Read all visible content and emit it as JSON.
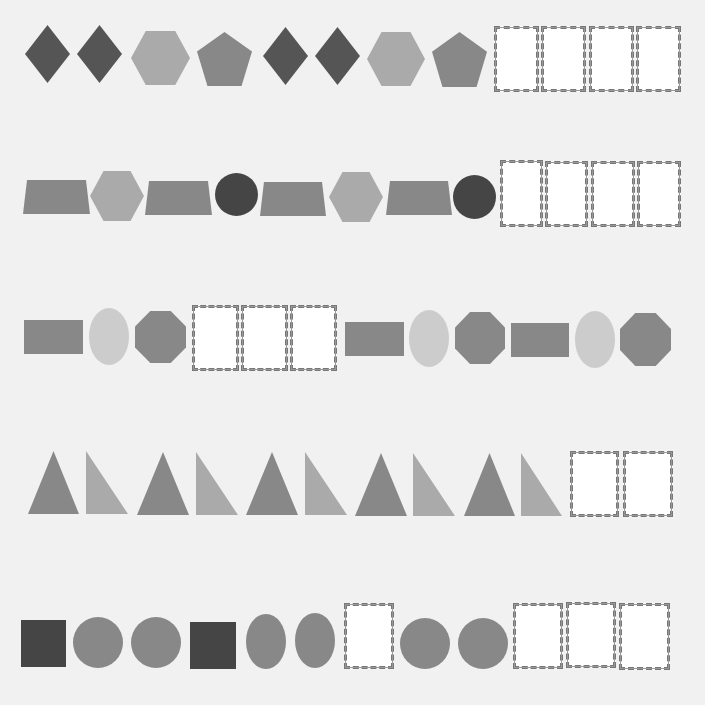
{
  "colors": {
    "background": "#f1f1f1",
    "dark": "#555555",
    "darker": "#454545",
    "medium": "#888888",
    "light": "#aaaaaa",
    "lighter": "#cccccc",
    "box_fill": "#ffffff",
    "box_border": "#777777"
  },
  "rows": [
    {
      "index": 1,
      "items": [
        {
          "type": "diamond",
          "color": "dark",
          "x": 25,
          "y": 25,
          "w": 45,
          "h": 58
        },
        {
          "type": "diamond",
          "color": "dark",
          "x": 77,
          "y": 25,
          "w": 45,
          "h": 58
        },
        {
          "type": "hexagon",
          "color": "light",
          "x": 131,
          "y": 31,
          "w": 59,
          "h": 54
        },
        {
          "type": "pentagon",
          "color": "medium",
          "x": 197,
          "y": 32,
          "w": 55,
          "h": 54
        },
        {
          "type": "diamond",
          "color": "dark",
          "x": 263,
          "y": 27,
          "w": 45,
          "h": 58
        },
        {
          "type": "diamond",
          "color": "dark",
          "x": 315,
          "y": 27,
          "w": 45,
          "h": 58
        },
        {
          "type": "hexagon",
          "color": "light",
          "x": 367,
          "y": 32,
          "w": 58,
          "h": 54
        },
        {
          "type": "pentagon",
          "color": "medium",
          "x": 432,
          "y": 32,
          "w": 55,
          "h": 55
        },
        {
          "type": "blank",
          "x": 494,
          "y": 26,
          "w": 45,
          "h": 66
        },
        {
          "type": "blank",
          "x": 541,
          "y": 26,
          "w": 45,
          "h": 66
        },
        {
          "type": "blank",
          "x": 589,
          "y": 26,
          "w": 45,
          "h": 66
        },
        {
          "type": "blank",
          "x": 636,
          "y": 26,
          "w": 45,
          "h": 66
        }
      ]
    },
    {
      "index": 2,
      "items": [
        {
          "type": "trapezoid",
          "color": "medium",
          "x": 23,
          "y": 180,
          "w": 67,
          "h": 34
        },
        {
          "type": "hexagon",
          "color": "light",
          "x": 90,
          "y": 171,
          "w": 54,
          "h": 50
        },
        {
          "type": "trapezoid",
          "color": "medium",
          "x": 145,
          "y": 181,
          "w": 67,
          "h": 34
        },
        {
          "type": "circle",
          "color": "darker",
          "x": 215,
          "y": 173,
          "w": 43,
          "h": 43
        },
        {
          "type": "trapezoid",
          "color": "medium",
          "x": 260,
          "y": 182,
          "w": 66,
          "h": 34
        },
        {
          "type": "hexagon",
          "color": "light",
          "x": 329,
          "y": 172,
          "w": 54,
          "h": 50
        },
        {
          "type": "trapezoid",
          "color": "medium",
          "x": 386,
          "y": 181,
          "w": 66,
          "h": 34
        },
        {
          "type": "circle",
          "color": "darker",
          "x": 453,
          "y": 175,
          "w": 43,
          "h": 44
        },
        {
          "type": "blank",
          "x": 500,
          "y": 160,
          "w": 43,
          "h": 67
        },
        {
          "type": "blank",
          "x": 545,
          "y": 161,
          "w": 43,
          "h": 66
        },
        {
          "type": "blank",
          "x": 591,
          "y": 161,
          "w": 44,
          "h": 66
        },
        {
          "type": "blank",
          "x": 637,
          "y": 161,
          "w": 44,
          "h": 66
        }
      ]
    },
    {
      "index": 3,
      "items": [
        {
          "type": "rectangle",
          "color": "medium",
          "x": 24,
          "y": 320,
          "w": 59,
          "h": 34
        },
        {
          "type": "ellipse",
          "color": "lighter",
          "x": 89,
          "y": 308,
          "w": 40,
          "h": 57
        },
        {
          "type": "octagon",
          "color": "medium",
          "x": 135,
          "y": 311,
          "w": 51,
          "h": 52
        },
        {
          "type": "blank",
          "x": 192,
          "y": 305,
          "w": 47,
          "h": 66
        },
        {
          "type": "blank",
          "x": 241,
          "y": 305,
          "w": 47,
          "h": 66
        },
        {
          "type": "blank",
          "x": 290,
          "y": 305,
          "w": 47,
          "h": 66
        },
        {
          "type": "rectangle",
          "color": "medium",
          "x": 345,
          "y": 322,
          "w": 59,
          "h": 34
        },
        {
          "type": "ellipse",
          "color": "lighter",
          "x": 409,
          "y": 310,
          "w": 40,
          "h": 57
        },
        {
          "type": "octagon",
          "color": "medium",
          "x": 455,
          "y": 312,
          "w": 50,
          "h": 52
        },
        {
          "type": "rectangle",
          "color": "medium",
          "x": 511,
          "y": 323,
          "w": 58,
          "h": 34
        },
        {
          "type": "ellipse",
          "color": "lighter",
          "x": 575,
          "y": 311,
          "w": 40,
          "h": 57
        },
        {
          "type": "octagon",
          "color": "medium",
          "x": 620,
          "y": 313,
          "w": 51,
          "h": 53
        }
      ]
    },
    {
      "index": 4,
      "items": [
        {
          "type": "triangle",
          "color": "medium",
          "x": 28,
          "y": 451,
          "w": 51,
          "h": 63
        },
        {
          "type": "right-triangle",
          "color": "light",
          "x": 86,
          "y": 451,
          "w": 42,
          "h": 63
        },
        {
          "type": "triangle",
          "color": "medium",
          "x": 137,
          "y": 452,
          "w": 52,
          "h": 63
        },
        {
          "type": "right-triangle",
          "color": "light",
          "x": 196,
          "y": 452,
          "w": 42,
          "h": 63
        },
        {
          "type": "triangle",
          "color": "medium",
          "x": 246,
          "y": 452,
          "w": 52,
          "h": 63
        },
        {
          "type": "right-triangle",
          "color": "light",
          "x": 305,
          "y": 452,
          "w": 42,
          "h": 63
        },
        {
          "type": "triangle",
          "color": "medium",
          "x": 355,
          "y": 453,
          "w": 52,
          "h": 63
        },
        {
          "type": "right-triangle",
          "color": "light",
          "x": 413,
          "y": 453,
          "w": 42,
          "h": 63
        },
        {
          "type": "triangle",
          "color": "medium",
          "x": 464,
          "y": 453,
          "w": 51,
          "h": 63
        },
        {
          "type": "right-triangle",
          "color": "light",
          "x": 521,
          "y": 453,
          "w": 41,
          "h": 63
        },
        {
          "type": "blank",
          "x": 570,
          "y": 451,
          "w": 49,
          "h": 66
        },
        {
          "type": "blank",
          "x": 623,
          "y": 451,
          "w": 50,
          "h": 66
        }
      ]
    },
    {
      "index": 5,
      "items": [
        {
          "type": "square",
          "color": "darker",
          "x": 21,
          "y": 620,
          "w": 45,
          "h": 47
        },
        {
          "type": "circle",
          "color": "medium",
          "x": 73,
          "y": 617,
          "w": 50,
          "h": 51
        },
        {
          "type": "circle",
          "color": "medium",
          "x": 131,
          "y": 617,
          "w": 50,
          "h": 51
        },
        {
          "type": "square",
          "color": "darker",
          "x": 190,
          "y": 622,
          "w": 46,
          "h": 47
        },
        {
          "type": "ellipse",
          "color": "medium",
          "x": 246,
          "y": 614,
          "w": 40,
          "h": 55
        },
        {
          "type": "ellipse",
          "color": "medium",
          "x": 295,
          "y": 613,
          "w": 40,
          "h": 55
        },
        {
          "type": "blank",
          "x": 344,
          "y": 603,
          "w": 50,
          "h": 66
        },
        {
          "type": "circle",
          "color": "medium",
          "x": 400,
          "y": 618,
          "w": 50,
          "h": 51
        },
        {
          "type": "circle",
          "color": "medium",
          "x": 458,
          "y": 618,
          "w": 50,
          "h": 51
        },
        {
          "type": "blank",
          "x": 513,
          "y": 603,
          "w": 50,
          "h": 66
        },
        {
          "type": "blank",
          "x": 566,
          "y": 602,
          "w": 50,
          "h": 66
        },
        {
          "type": "blank",
          "x": 619,
          "y": 603,
          "w": 51,
          "h": 67
        }
      ]
    }
  ]
}
